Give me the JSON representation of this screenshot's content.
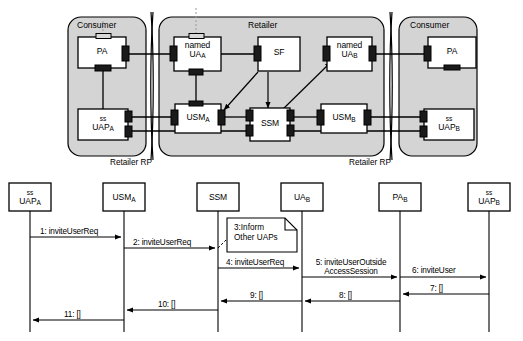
{
  "diagram": {
    "type": "uml-component-and-sequence",
    "architecture": {
      "domains": [
        {
          "name": "consumer-left",
          "title": "Consumer"
        },
        {
          "name": "retailer",
          "title": "Retailer"
        },
        {
          "name": "consumer-right",
          "title": "Consumer"
        }
      ],
      "reference_points": [
        {
          "name": "retailer-rp-left",
          "label": "Retailer  RP"
        },
        {
          "name": "retailer-rp-right",
          "label": "Retailer  RP"
        }
      ],
      "components": [
        {
          "id": "pa-a",
          "label": "PA",
          "sub": "",
          "prefix": ""
        },
        {
          "id": "uap-a",
          "label": "UAP",
          "sub": "A",
          "prefix": "ss"
        },
        {
          "id": "ua-a",
          "label": "UA",
          "sub": "A",
          "prefix": "named"
        },
        {
          "id": "sf",
          "label": "SF",
          "sub": "",
          "prefix": ""
        },
        {
          "id": "usm-a",
          "label": "USM",
          "sub": "A",
          "prefix": ""
        },
        {
          "id": "ssm",
          "label": "SSM",
          "sub": "",
          "prefix": ""
        },
        {
          "id": "ua-b",
          "label": "UA",
          "sub": "B",
          "prefix": "named"
        },
        {
          "id": "usm-b",
          "label": "USM",
          "sub": "B",
          "prefix": ""
        },
        {
          "id": "pa-b",
          "label": "PA",
          "sub": "",
          "prefix": ""
        },
        {
          "id": "uap-b",
          "label": "UAP",
          "sub": "B",
          "prefix": "ss"
        }
      ],
      "flows": [
        {
          "from": "sf",
          "to": "usm-a",
          "style": "arrow"
        },
        {
          "from": "sf",
          "to": "ssm",
          "style": "arrow"
        },
        {
          "from": "ssm",
          "to": "ua-b",
          "style": "arrow"
        }
      ]
    },
    "sequence": {
      "lifelines": [
        {
          "id": "ll-uap-a",
          "prefix": "ss",
          "label": "UAP",
          "sub": "A"
        },
        {
          "id": "ll-usm-a",
          "prefix": "",
          "label": "USM",
          "sub": "A"
        },
        {
          "id": "ll-ssm",
          "prefix": "",
          "label": "SSM",
          "sub": ""
        },
        {
          "id": "ll-ua-b",
          "prefix": "",
          "label": "UA",
          "sub": "B"
        },
        {
          "id": "ll-pa-b",
          "prefix": "",
          "label": "PA",
          "sub": "B"
        },
        {
          "id": "ll-uap-b",
          "prefix": "ss",
          "label": "UAP",
          "sub": "B"
        }
      ],
      "messages": [
        {
          "num": "1",
          "text": "1: inviteUserReq",
          "from": "ll-uap-a",
          "to": "ll-usm-a",
          "dir": "right"
        },
        {
          "num": "2",
          "text": "2: inviteUserReq",
          "from": "ll-usm-a",
          "to": "ll-ssm",
          "dir": "right"
        },
        {
          "num": "4",
          "text": "4: inviteUserReq",
          "from": "ll-ssm",
          "to": "ll-ua-b",
          "dir": "right"
        },
        {
          "num": "5",
          "line1": "5: inviteUserOutside",
          "line2": "AccessSession",
          "from": "ll-ua-b",
          "to": "ll-pa-b",
          "dir": "right"
        },
        {
          "num": "6",
          "text": "6: inviteUser",
          "from": "ll-pa-b",
          "to": "ll-uap-b",
          "dir": "right"
        },
        {
          "num": "7",
          "text": "7: []",
          "from": "ll-uap-b",
          "to": "ll-pa-b",
          "dir": "left"
        },
        {
          "num": "8",
          "text": "8: []",
          "from": "ll-pa-b",
          "to": "ll-ua-b",
          "dir": "left"
        },
        {
          "num": "9",
          "text": "9: []",
          "from": "ll-ua-b",
          "to": "ll-ssm",
          "dir": "left"
        },
        {
          "num": "10",
          "text": "10: []",
          "from": "ll-ssm",
          "to": "ll-usm-a",
          "dir": "left"
        },
        {
          "num": "11",
          "text": "11: []",
          "from": "ll-usm-a",
          "to": "ll-uap-a",
          "dir": "left"
        }
      ],
      "note": {
        "line1": "3:Inform",
        "line2": "Other UAPs",
        "attached_to": "ll-ssm"
      }
    },
    "colors": {
      "domain_fill": "#d4d4d4",
      "box_fill": "#ffffff",
      "port_fill": "#1a1a1a",
      "line": "#000000"
    }
  }
}
